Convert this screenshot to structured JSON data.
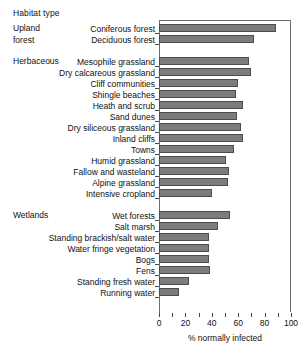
{
  "chart_title": "Habitat type",
  "axis": {
    "xlabel": "% normally infected",
    "ticks": [
      0,
      20,
      40,
      60,
      80,
      100
    ],
    "minor_step": 10,
    "xmin": 0,
    "xmax": 100
  },
  "groups": [
    {
      "name": "Upland forest",
      "lines": [
        "Upland",
        "forest"
      ]
    },
    {
      "name": "Herbaceous",
      "lines": [
        "Herbaceous"
      ]
    },
    {
      "name": "Wetlands",
      "lines": [
        "Wetlands"
      ]
    }
  ],
  "chart_data": {
    "type": "bar",
    "orientation": "horizontal",
    "title": "Habitat type",
    "xlabel": "% normally infected",
    "ylabel": "Habitat type",
    "xlim": [
      0,
      100
    ],
    "grid": false,
    "legend": "none",
    "categories": [
      "Coniferous forest",
      "Deciduous forest",
      "Mesophile grassland",
      "Dry calcareous grassland",
      "Cliff communities",
      "Shingle beaches",
      "Heath and scrub",
      "Sand dunes",
      "Dry siliceous grassland",
      "Inland cliffs",
      "Towns",
      "Humid grassland",
      "Fallow and wasteland",
      "Alpine grassland",
      "Intensive cropland",
      "Wet forests",
      "Salt marsh",
      "Standing brackish/salt water",
      "Water fringe vegetation",
      "Bogs",
      "Fens",
      "Standing fresh water",
      "Running water"
    ],
    "values": [
      89,
      72,
      68,
      70,
      60,
      58,
      64,
      59,
      62,
      64,
      57,
      51,
      53,
      52,
      40,
      54,
      45,
      38,
      38,
      38,
      39,
      23,
      15
    ],
    "group_of_category": [
      "Upland forest",
      "Upland forest",
      "Herbaceous",
      "Herbaceous",
      "Herbaceous",
      "Herbaceous",
      "Herbaceous",
      "Herbaceous",
      "Herbaceous",
      "Herbaceous",
      "Herbaceous",
      "Herbaceous",
      "Herbaceous",
      "Herbaceous",
      "Herbaceous",
      "Wetlands",
      "Wetlands",
      "Wetlands",
      "Wetlands",
      "Wetlands",
      "Wetlands",
      "Wetlands",
      "Wetlands"
    ]
  },
  "colors": {
    "bar_fill": "#7c7c7c",
    "bar_edge": "#4c4c4c",
    "axis": "#6e6e6e",
    "text": "#111111",
    "background": "#ffffff"
  }
}
